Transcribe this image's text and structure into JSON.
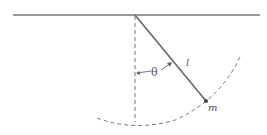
{
  "diagram": {
    "type": "simple pendulum",
    "labels": {
      "angle": "θ",
      "length": "l",
      "mass": "m"
    },
    "colors": {
      "line": "#777777",
      "rod": "#666666",
      "text": "#555555"
    }
  }
}
